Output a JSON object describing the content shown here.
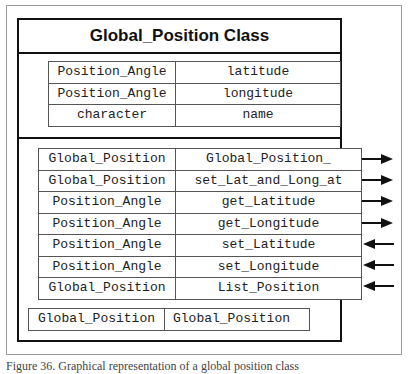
{
  "diagram": {
    "title": "Global_Position Class",
    "attributes": [
      {
        "type": "Position_Angle",
        "name": "latitude"
      },
      {
        "type": "Position_Angle",
        "name": "longitude"
      },
      {
        "type": "character",
        "name": "name"
      }
    ],
    "methods": [
      {
        "type": "Global_Position",
        "name": "Global_Position_",
        "direction": "out"
      },
      {
        "type": "Global_Position",
        "name": "set_Lat_and_Long_at",
        "direction": "out"
      },
      {
        "type": "Position_Angle",
        "name": "get_Latitude",
        "direction": "out"
      },
      {
        "type": "Position_Angle",
        "name": "get_Longitude",
        "direction": "out"
      },
      {
        "type": "Position_Angle",
        "name": "set_Latitude",
        "direction": "in"
      },
      {
        "type": "Position_Angle",
        "name": "set_Longitude",
        "direction": "in"
      },
      {
        "type": "Global_Position",
        "name": "List_Position",
        "direction": "in"
      }
    ],
    "constructor": {
      "type": "Global_Position",
      "name": "Global_Position"
    }
  },
  "caption": "Figure 36. Graphical representation of a global position class"
}
